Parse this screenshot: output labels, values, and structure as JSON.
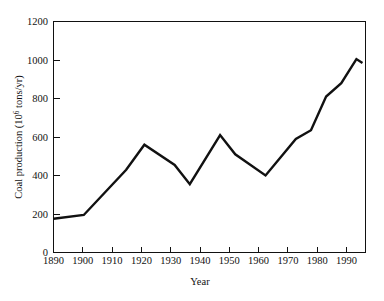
{
  "chart_data": {
    "type": "line",
    "title": "",
    "xlabel": "Year",
    "ylabel_parts": {
      "prefix": "Coal production (10",
      "exponent": "6",
      "suffix": " tons/yr)"
    },
    "ylabel": "Coal production (10^6 tons/yr)",
    "xlim": [
      1890,
      1993
    ],
    "ylim": [
      0,
      1200
    ],
    "xticks": [
      1890,
      1900,
      1910,
      1920,
      1930,
      1940,
      1950,
      1960,
      1970,
      1980,
      1990
    ],
    "yticks": [
      0,
      200,
      400,
      600,
      800,
      1000,
      1200
    ],
    "grid": false,
    "legend": false,
    "line_color": "#111111",
    "background_color": "#ffffff",
    "series": [
      {
        "name": "Coal production",
        "x": [
          1890,
          1900,
          1914,
          1920,
          1930,
          1935,
          1945,
          1950,
          1960,
          1970,
          1975,
          1980,
          1985,
          1990,
          1992
        ],
        "values": [
          175,
          195,
          430,
          560,
          455,
          355,
          610,
          510,
          400,
          590,
          635,
          810,
          880,
          1005,
          985
        ]
      }
    ]
  }
}
